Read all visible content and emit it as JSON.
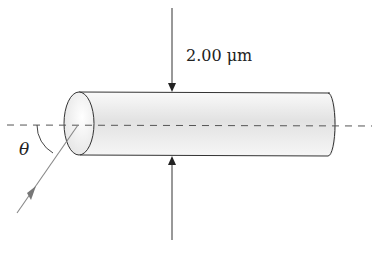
{
  "diagram": {
    "type": "optical fiber cylinder with incident light ray",
    "dimension_label": "2.00 μm",
    "angle_label": "θ",
    "colors": {
      "outline": "#333333",
      "axis_dashed": "#555555",
      "ray": "#777777",
      "cylinder_fill": "#e6e6e6"
    }
  }
}
